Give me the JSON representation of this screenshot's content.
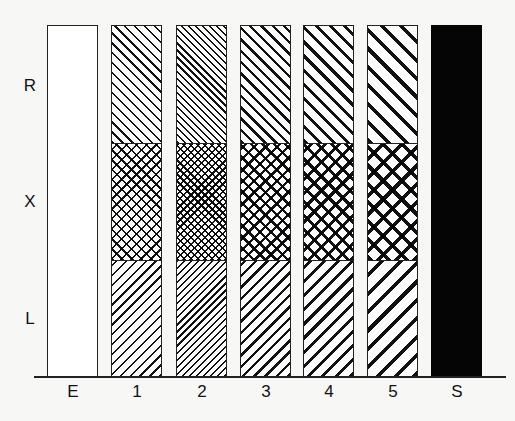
{
  "y_labels": [
    "R",
    "X",
    "L"
  ],
  "x_labels": [
    "E",
    "1",
    "2",
    "3",
    "4",
    "5",
    "S"
  ],
  "bars": [
    {
      "label": "E",
      "fill": "empty",
      "x": 47
    },
    {
      "label": "1",
      "fill": "pattern",
      "x": 111,
      "spacing": 7,
      "stroke": 1.6
    },
    {
      "label": "2",
      "fill": "pattern",
      "x": 176,
      "spacing": 5,
      "stroke": 1.6
    },
    {
      "label": "3",
      "fill": "pattern",
      "x": 240,
      "spacing": 8,
      "stroke": 2.4
    },
    {
      "label": "4",
      "fill": "pattern",
      "x": 303,
      "spacing": 10,
      "stroke": 3
    },
    {
      "label": "5",
      "fill": "pattern",
      "x": 367,
      "spacing": 13,
      "stroke": 3.6
    },
    {
      "label": "S",
      "fill": "solid",
      "x": 431
    }
  ],
  "regions": {
    "R": "forward diagonal hatch",
    "X": "cross hatch",
    "L": "backward diagonal hatch"
  },
  "colors": {
    "ink": "#111111",
    "background": "#f7f7f6",
    "solid": "#050505"
  }
}
